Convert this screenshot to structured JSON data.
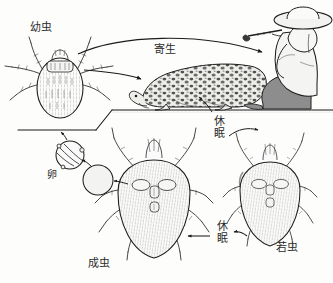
{
  "figure": {
    "kind": "life-cycle-diagram",
    "background_color": "#fdfdfc",
    "ink_color": "#1b1b1b"
  },
  "labels": {
    "larva": "幼虫",
    "parasitism": "寄生",
    "egg": "卵",
    "adult": "成虫",
    "nymph": "若虫",
    "dormancy_upper": "休眠",
    "dormancy_lower": "休眠"
  },
  "stages": [
    {
      "id": "larva",
      "label": "幼虫",
      "position": "top-left",
      "legs": 6
    },
    {
      "id": "egg",
      "label": "卵",
      "position": "middle-left",
      "legs": 0
    },
    {
      "id": "adult",
      "label": "成虫",
      "position": "bottom-center",
      "legs": 8
    },
    {
      "id": "nymph",
      "label": "若虫",
      "position": "bottom-right",
      "legs": 8
    }
  ],
  "hosts": [
    {
      "id": "human",
      "description": "seated-person-with-wide-brim-hat",
      "shirt_color": "#f2f2f0",
      "trousers_color": "#8d8d8d"
    },
    {
      "id": "lizard",
      "description": "mottled-spotted-lizard",
      "body_color": "#e9e9e6"
    }
  ],
  "transitions": [
    {
      "id": "larva-to-human",
      "label": "寄生",
      "from": "larva",
      "to": "human"
    },
    {
      "id": "larva-to-lizard",
      "label": "寄生",
      "from": "larva",
      "to": "lizard"
    },
    {
      "id": "nymph-dormancy",
      "label": "休眠",
      "from": "larva",
      "to": "nymph"
    },
    {
      "id": "adult-dormancy",
      "label": "休眠",
      "from": "nymph",
      "to": "adult"
    },
    {
      "id": "adult-to-egg",
      "label": "",
      "from": "adult",
      "to": "egg"
    },
    {
      "id": "egg-to-larva",
      "label": "",
      "from": "egg",
      "to": "larva"
    }
  ]
}
